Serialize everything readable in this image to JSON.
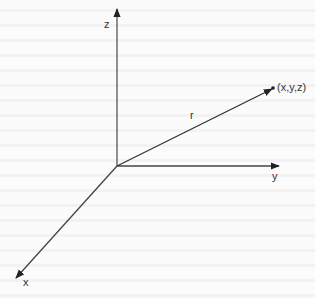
{
  "diagram": {
    "type": "3d-coordinate-system",
    "colors": {
      "line": "#444444",
      "text": "#333333",
      "background": "#fbfbfb"
    },
    "origin": {
      "x": 117,
      "y": 166
    },
    "axes": [
      {
        "name": "z",
        "label": "z",
        "tip": {
          "x": 117,
          "y": 8
        }
      },
      {
        "name": "y",
        "label": "y",
        "tip": {
          "x": 280,
          "y": 166
        }
      },
      {
        "name": "x",
        "label": "x",
        "tip": {
          "x": 15,
          "y": 279
        }
      }
    ],
    "vector": {
      "label": "r",
      "from": {
        "x": 117,
        "y": 166
      },
      "to": {
        "x": 273,
        "y": 88
      }
    },
    "point": {
      "label": "(x,y,z)"
    }
  }
}
